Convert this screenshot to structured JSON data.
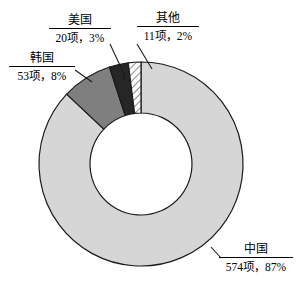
{
  "chart_data": {
    "type": "pie",
    "variant": "donut",
    "title": "",
    "subtitle": "",
    "xlabel": "",
    "ylabel": "",
    "legend_position": "none",
    "grid": false,
    "unit_label": "项",
    "total_items": 658,
    "categories": [
      "中国",
      "韩国",
      "美国",
      "其他"
    ],
    "values": [
      574,
      53,
      20,
      11
    ],
    "percents": [
      87,
      8,
      3,
      2
    ],
    "slices": [
      {
        "name": "中国",
        "value": 574,
        "percent": 87,
        "value_text": "574项，87%",
        "fill": "#d6d6d6",
        "pattern": "solid",
        "start_angle": 0,
        "end_angle": 313.2
      },
      {
        "name": "韩国",
        "value": 53,
        "percent": 8,
        "value_text": "53项，8%",
        "fill": "#7f7f7f",
        "pattern": "solid",
        "start_angle": 313.2,
        "end_angle": 342.2
      },
      {
        "name": "美国",
        "value": 20,
        "percent": 3,
        "value_text": "20项，3%",
        "fill": "#262626",
        "pattern": "solid",
        "start_angle": 342.2,
        "end_angle": 353.1
      },
      {
        "name": "其他",
        "value": 11,
        "percent": 2,
        "value_text": "11项，2%",
        "fill": "#ffffff",
        "pattern": "diagonal-hatch",
        "start_angle": 353.1,
        "end_angle": 360
      }
    ],
    "annotations": [
      {
        "label": "美国",
        "value_text": "20项，3%"
      },
      {
        "label": "其他",
        "value_text": "11项，2%"
      },
      {
        "label": "韩国",
        "value_text": "53项，8%"
      },
      {
        "label": "中国",
        "value_text": "574项，87%"
      }
    ]
  },
  "callouts": {
    "us": {
      "category": "美国",
      "value_text": "20项，3%"
    },
    "other": {
      "category": "其他",
      "value_text": "11项，2%"
    },
    "kr": {
      "category": "韩国",
      "value_text": "53项，8%"
    },
    "cn": {
      "category": "中国",
      "value_text": "574项，87%"
    }
  },
  "colors": {
    "china": "#d6d6d6",
    "korea": "#7f7f7f",
    "usa": "#262626",
    "other": "#ffffff",
    "outline": "#1a1a1a",
    "background": "#ffffff"
  }
}
